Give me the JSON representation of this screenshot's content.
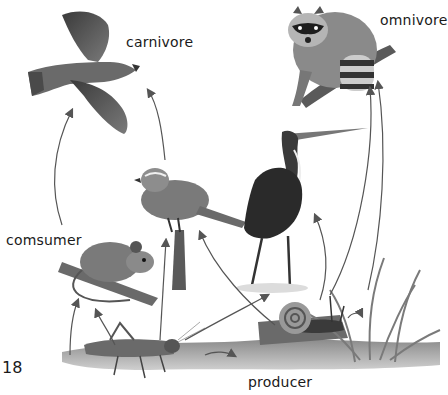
{
  "diagram": {
    "type": "food-web",
    "page_number": "18",
    "labels": {
      "carnivore": "carnivore",
      "omnivore": "omnivore",
      "consumer": "comsumer",
      "producer": "producer"
    },
    "organisms": [
      {
        "id": "hawk",
        "role": "carnivore"
      },
      {
        "id": "raccoon",
        "role": "omnivore"
      },
      {
        "id": "sparrow",
        "role": "consumer"
      },
      {
        "id": "heron",
        "role": "consumer"
      },
      {
        "id": "mouse",
        "role": "consumer"
      },
      {
        "id": "grasshopper",
        "role": "consumer"
      },
      {
        "id": "snail",
        "role": "consumer"
      },
      {
        "id": "grass",
        "role": "producer"
      }
    ],
    "arrows": [
      {
        "from": "mouse",
        "to": "hawk"
      },
      {
        "from": "sparrow",
        "to": "hawk"
      },
      {
        "from": "grasshopper",
        "to": "mouse"
      },
      {
        "from": "grasshopper",
        "to": "sparrow"
      },
      {
        "from": "grasshopper",
        "to": "heron"
      },
      {
        "from": "grass",
        "to": "mouse"
      },
      {
        "from": "grass",
        "to": "grasshopper"
      },
      {
        "from": "grass",
        "to": "snail"
      },
      {
        "from": "snail",
        "to": "sparrow"
      },
      {
        "from": "snail",
        "to": "heron"
      },
      {
        "from": "snail",
        "to": "raccoon"
      },
      {
        "from": "grass",
        "to": "raccoon"
      }
    ],
    "colors": {
      "ink": "#1a1a1a",
      "arrow": "#555555",
      "background": "#ffffff"
    }
  }
}
